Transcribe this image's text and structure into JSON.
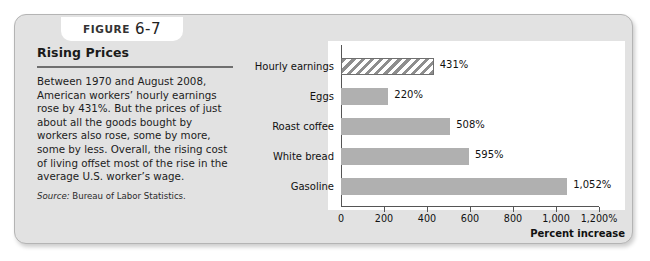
{
  "figure": {
    "label": "Figure",
    "number": "6-7"
  },
  "panel": {
    "title": "Rising Prices",
    "body": "Between 1970 and August 2008, American workers’ hourly earnings rose by 431%. But the prices of just about all the goods bought by workers also rose, some by more, some by less. Overall, the rising cost of living offset most of the rise in the average U.S. worker’s wage.",
    "source_label": "Source:",
    "source_text": "Bureau of Labor Statistics."
  },
  "chart_data": {
    "type": "bar",
    "orientation": "horizontal",
    "title": "",
    "xlabel": "Percent increase",
    "ylabel": "",
    "categories": [
      "Hourly earnings",
      "Eggs",
      "Roast coffee",
      "White bread",
      "Gasoline"
    ],
    "values": [
      431,
      220,
      508,
      595,
      1052
    ],
    "value_labels": [
      "431%",
      "220%",
      "508%",
      "595%",
      "1,052%"
    ],
    "highlight_index": 0,
    "xlim": [
      0,
      1200
    ],
    "xticks": [
      0,
      200,
      400,
      600,
      800,
      1000,
      1200
    ],
    "xticklabels": [
      "0",
      "200",
      "400",
      "600",
      "800",
      "1,000",
      "1,200%"
    ],
    "grid": false,
    "legend": null,
    "bar_color": "#b0b0b0",
    "highlight_pattern": "diagonal-hatch",
    "axis_color": "#555555",
    "plot_background": "#ffffff",
    "panel_background": "#e2e2e2"
  }
}
